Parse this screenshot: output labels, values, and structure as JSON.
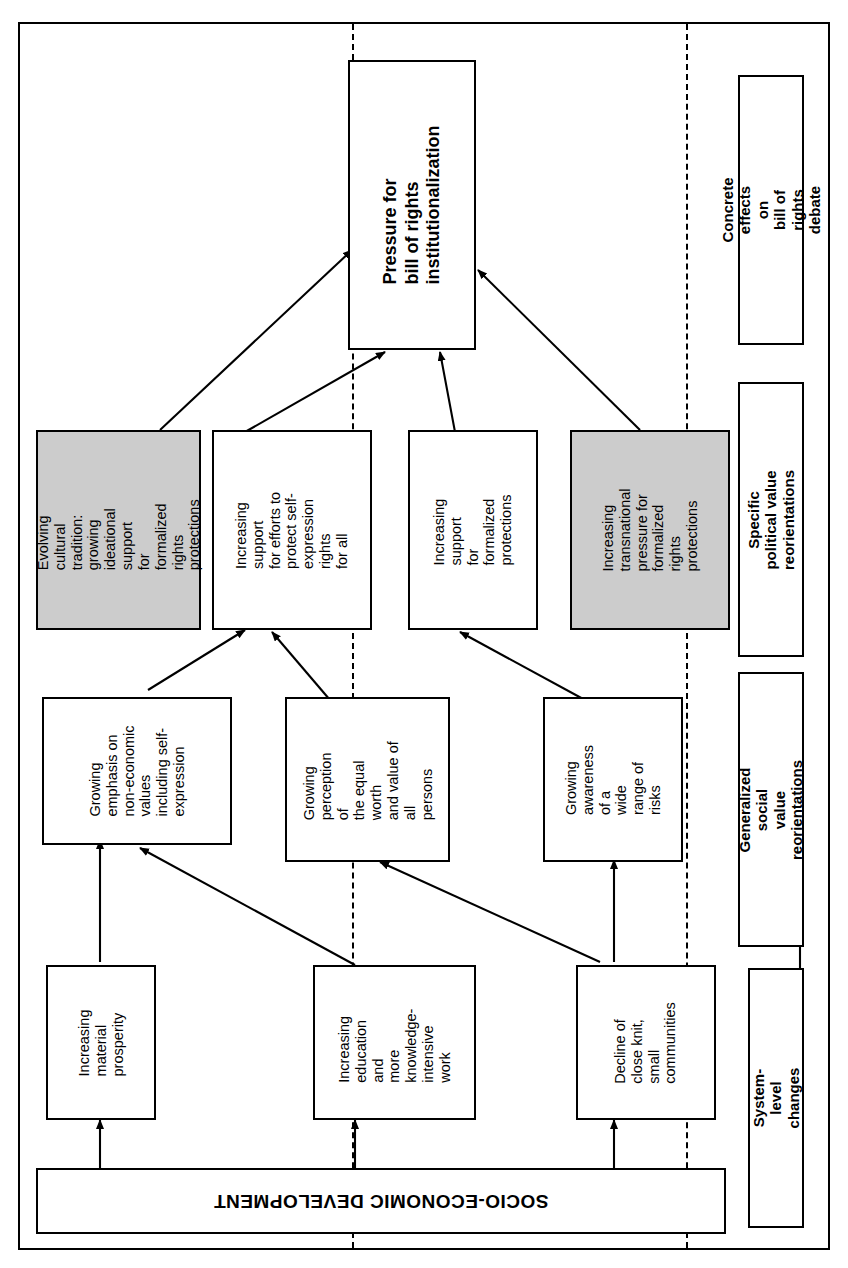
{
  "figure": {
    "orientation": "rotated-90-ccw",
    "root": {
      "label": "SOCIO-ECONOMIC DEVELOPMENT"
    },
    "outcome": {
      "label": "Pressure for\nbill of rights\ninstitutionalization"
    },
    "bands": [
      {
        "id": "concrete-effects",
        "label": "Concrete effects on\nbill of rights debate"
      },
      {
        "id": "specific-political",
        "label": "Specific political value\nreorientations"
      },
      {
        "id": "generalized-social",
        "label": "Generalized social\nvalue reorientations"
      },
      {
        "id": "system-level",
        "label": "System-level changes"
      }
    ],
    "nodes": {
      "political": [
        {
          "id": "evolving-cultural-tradition",
          "label": "Evolving cultural\ntradition:  growing\nideational support\nfor formalized\nrights protections",
          "shaded": true
        },
        {
          "id": "support-self-expression",
          "label": "Increasing support\nfor efforts to\nprotect self-\nexpression rights\nfor all",
          "shaded": false
        },
        {
          "id": "support-formalized-protections",
          "label": "Increasing support\nfor formalized\nprotections",
          "shaded": false
        },
        {
          "id": "transnational-pressure",
          "label": "Increasing\ntransnational\npressure for\nformalized rights\nprotections",
          "shaded": true
        }
      ],
      "social": [
        {
          "id": "non-economic-values",
          "label": "Growing\nemphasis on\nnon-economic\nvalues\nincluding self-\nexpression",
          "shaded": false
        },
        {
          "id": "equal-worth",
          "label": "Growing\nperception of\nthe equal worth\nand value of all\npersons",
          "shaded": false
        },
        {
          "id": "awareness-risks",
          "label": "Growing\nawareness of a\nwide range of\nrisks",
          "shaded": false
        }
      ],
      "system": [
        {
          "id": "material-prosperity",
          "label": "Increasing\nmaterial\nprosperity",
          "shaded": false
        },
        {
          "id": "education-knowledge",
          "label": "Increasing\neducation and\nmore\nknowledge-\nintensive work",
          "shaded": false
        },
        {
          "id": "decline-communities",
          "label": "Decline of\nclose knit,\nsmall\ncommunities",
          "shaded": false
        }
      ]
    },
    "colors": {
      "shaded_fill": "#cccccc",
      "line": "#000000",
      "background": "#ffffff"
    }
  }
}
